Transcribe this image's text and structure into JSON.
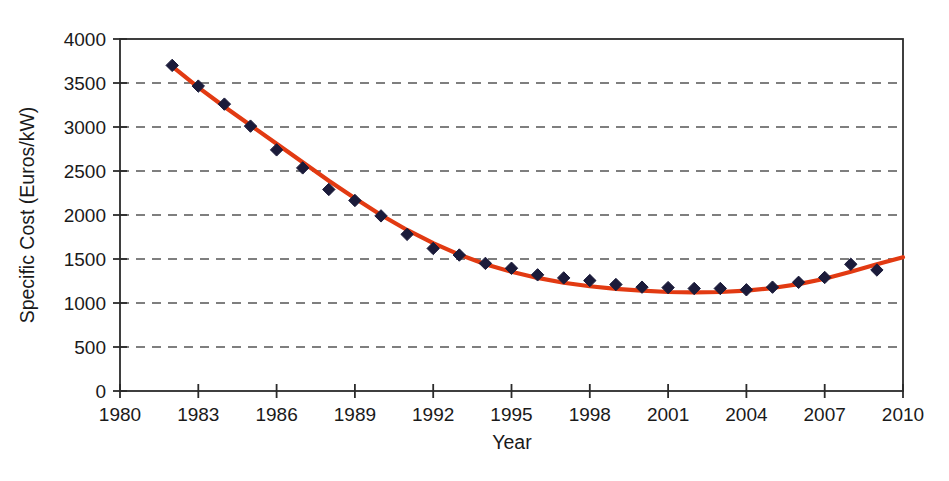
{
  "chart_data": {
    "type": "scatter",
    "title": "",
    "subtitle": "",
    "xlabel": "Year",
    "ylabel": "Specific Cost (Euros/kW)",
    "xlim": [
      1980,
      2010
    ],
    "ylim": [
      0,
      4000
    ],
    "xticks": [
      1980,
      1983,
      1986,
      1989,
      1992,
      1995,
      1998,
      2001,
      2004,
      2007,
      2010
    ],
    "yticks": [
      0,
      500,
      1000,
      1500,
      2000,
      2500,
      3000,
      3500,
      4000
    ],
    "xtick_labels": [
      "1980",
      "1983",
      "1986",
      "1989",
      "1992",
      "1995",
      "1998",
      "2001",
      "2004",
      "2007",
      "2010"
    ],
    "ytick_labels": [
      "0",
      "500",
      "1000",
      "1500",
      "2000",
      "2500",
      "3000",
      "3500",
      "4000"
    ],
    "grid": "horizontal-dashed",
    "legend": "none",
    "annotations": [],
    "series": [
      {
        "name": "Specific Cost data points",
        "kind": "scatter",
        "marker": "diamond",
        "color": "#1b1b3a",
        "x": [
          1982,
          1983,
          1984,
          1985,
          1986,
          1987,
          1988,
          1989,
          1990,
          1991,
          1992,
          1993,
          1994,
          1995,
          1996,
          1997,
          1998,
          1999,
          2000,
          2001,
          2002,
          2003,
          2004,
          2005,
          2006,
          2007,
          2008,
          2009
        ],
        "values": [
          3700,
          3465,
          3260,
          3010,
          2740,
          2535,
          2290,
          2165,
          1990,
          1780,
          1620,
          1545,
          1450,
          1395,
          1320,
          1285,
          1255,
          1210,
          1180,
          1175,
          1165,
          1165,
          1150,
          1180,
          1235,
          1290,
          1440,
          1375
        ]
      },
      {
        "name": "Fitted trend curve",
        "kind": "line",
        "color": "#e23a12",
        "x": [
          1982,
          1983,
          1984,
          1985,
          1986,
          1987,
          1988,
          1989,
          1990,
          1991,
          1992,
          1993,
          1994,
          1995,
          1996,
          1997,
          1998,
          1999,
          2000,
          2001,
          2002,
          2003,
          2004,
          2005,
          2006,
          2007,
          2008,
          2009,
          2010
        ],
        "values": [
          3690,
          3450,
          3230,
          3020,
          2810,
          2600,
          2390,
          2190,
          2000,
          1830,
          1680,
          1550,
          1440,
          1355,
          1285,
          1230,
          1190,
          1160,
          1140,
          1125,
          1120,
          1125,
          1140,
          1170,
          1215,
          1275,
          1355,
          1440,
          1520
        ]
      }
    ]
  },
  "colors": {
    "marker": "#1b1b3a",
    "curve": "#e23a12",
    "axis": "#2b2b2b",
    "grid": "#555555",
    "background": "#ffffff",
    "text": "#1a1a1a"
  },
  "axes_geometry": {
    "left_px": 120,
    "right_px": 903,
    "top_px": 39,
    "bottom_px": 391
  }
}
